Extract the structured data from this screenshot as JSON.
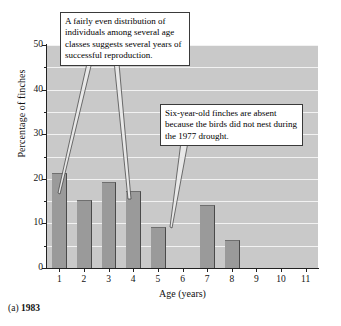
{
  "caption": {
    "label": "(a)",
    "year": "1983"
  },
  "chart_data": {
    "type": "bar",
    "title": "",
    "xlabel": "Age (years)",
    "ylabel": "Percentage of finches",
    "categories": [
      "1",
      "2",
      "3",
      "4",
      "5",
      "6",
      "7",
      "8",
      "9",
      "10",
      "11"
    ],
    "values": [
      21,
      15,
      19,
      17,
      9,
      0,
      14,
      6,
      0,
      0,
      0
    ],
    "ylim": [
      0,
      50
    ],
    "ytick_labels": [
      "0",
      "10",
      "20",
      "30",
      "40",
      "50"
    ],
    "ytick_values": [
      0,
      10,
      20,
      30,
      40,
      50
    ],
    "yminor_values": [
      5,
      15,
      25,
      35,
      45
    ],
    "grid": true,
    "grid_axis": "y",
    "grid_step": 5,
    "legend": "none",
    "bar_color": "#9a9a9a",
    "plot_background": "#c9c9c9",
    "gridline_color": "#f2f2f2"
  },
  "annotations": [
    {
      "id": "reproduction",
      "text": "A fairly even distribution of individuals among several age classes suggests several years of successful reproduction.",
      "points_to": [
        "1",
        "4"
      ]
    },
    {
      "id": "drought",
      "text": "Six-year-old finches are absent because the birds did not nest during the 1977 drought.",
      "points_to": [
        "6"
      ]
    }
  ]
}
